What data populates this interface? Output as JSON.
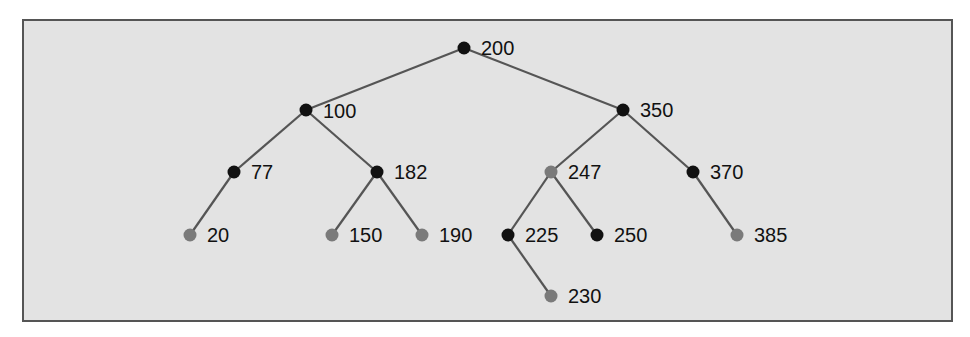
{
  "diagram": {
    "type": "red-black-tree",
    "colors": {
      "background": "#e3e3e3",
      "border": "#555555",
      "edge": "#555555",
      "black_node": "#111111",
      "red_node": "#7a7a7a",
      "label": "#111111"
    },
    "nodes": [
      {
        "id": "n200",
        "label": "200",
        "color": "black",
        "x": 464,
        "y": 48
      },
      {
        "id": "n100",
        "label": "100",
        "color": "black",
        "x": 306,
        "y": 110
      },
      {
        "id": "n350",
        "label": "350",
        "color": "black",
        "x": 623,
        "y": 110
      },
      {
        "id": "n77",
        "label": "77",
        "color": "black",
        "x": 234,
        "y": 172
      },
      {
        "id": "n182",
        "label": "182",
        "color": "black",
        "x": 377,
        "y": 172
      },
      {
        "id": "n247",
        "label": "247",
        "color": "red",
        "x": 551,
        "y": 172
      },
      {
        "id": "n370",
        "label": "370",
        "color": "black",
        "x": 693,
        "y": 172
      },
      {
        "id": "n20",
        "label": "20",
        "color": "red",
        "x": 190,
        "y": 235
      },
      {
        "id": "n150",
        "label": "150",
        "color": "red",
        "x": 332,
        "y": 235
      },
      {
        "id": "n190",
        "label": "190",
        "color": "red",
        "x": 422,
        "y": 235
      },
      {
        "id": "n225",
        "label": "225",
        "color": "black",
        "x": 508,
        "y": 235
      },
      {
        "id": "n250",
        "label": "250",
        "color": "black",
        "x": 597,
        "y": 235
      },
      {
        "id": "n385",
        "label": "385",
        "color": "red",
        "x": 737,
        "y": 235
      },
      {
        "id": "n230",
        "label": "230",
        "color": "red",
        "x": 551,
        "y": 296
      }
    ],
    "edges": [
      [
        "n200",
        "n100"
      ],
      [
        "n200",
        "n350"
      ],
      [
        "n100",
        "n77"
      ],
      [
        "n100",
        "n182"
      ],
      [
        "n350",
        "n247"
      ],
      [
        "n350",
        "n370"
      ],
      [
        "n77",
        "n20"
      ],
      [
        "n182",
        "n150"
      ],
      [
        "n182",
        "n190"
      ],
      [
        "n247",
        "n225"
      ],
      [
        "n247",
        "n250"
      ],
      [
        "n370",
        "n385"
      ],
      [
        "n225",
        "n230"
      ]
    ]
  }
}
